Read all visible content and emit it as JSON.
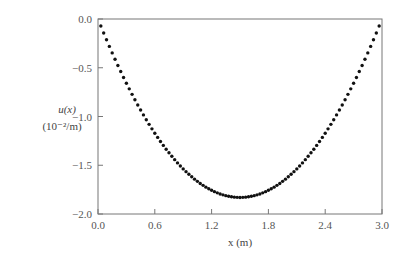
{
  "chart_data": {
    "type": "scatter",
    "title": "",
    "xlabel": "x (m)",
    "ylabel_line1": "u(x)",
    "ylabel_line2": "(10⁻²/m)",
    "xlim": [
      0.0,
      3.0
    ],
    "ylim": [
      -2.0,
      0.0
    ],
    "xticks": [
      "0.0",
      "0.6",
      "1.2",
      "1.8",
      "2.4",
      "3.0"
    ],
    "yticks": [
      "0.0",
      "-0.5",
      "-1.0",
      "-1.5",
      "-2.0"
    ],
    "grid": false,
    "legend": null,
    "marker": "filled-circle",
    "series": [
      {
        "name": "u(x)",
        "description": "Parabolic profile u(x) ≈ -0.813·x·(3−x), points every 0.03 m from 0.03 to 2.97",
        "x_start": 0.03,
        "x_end": 2.97,
        "x_step": 0.03,
        "min_value": -1.83,
        "min_at_x": 1.5,
        "endpoint_value": -0.07
      }
    ]
  },
  "layout": {
    "plot_left": 98,
    "plot_right": 382,
    "plot_top": 19,
    "plot_bottom": 214,
    "marker_color": "#111111",
    "axis_color": "#777777"
  }
}
